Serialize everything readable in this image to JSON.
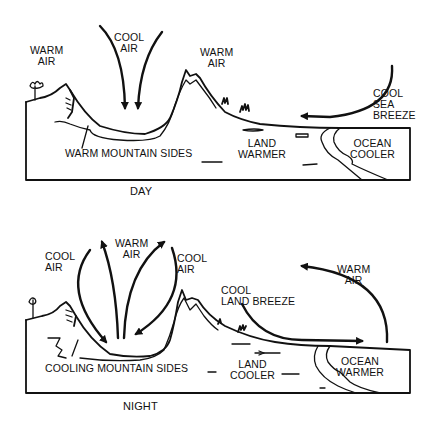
{
  "diagram": {
    "day": {
      "caption": "DAY",
      "labels": {
        "warm_air_left": "WARM\nAIR",
        "cool_air": "COOL\nAIR",
        "warm_air_right": "WARM\nAIR",
        "cool_sea_breeze": "COOL\nSEA\nBREEZE",
        "warm_mountain_sides": "WARM MOUNTAIN SIDES",
        "land_warmer": "LAND\nWARMER",
        "ocean_cooler": "OCEAN\nCOOLER"
      }
    },
    "night": {
      "caption": "NIGHT",
      "labels": {
        "cool_air_left": "COOL\nAIR",
        "warm_air_center": "WARM\nAIR",
        "cool_air_right": "COOL\nAIR",
        "warm_air_right": "WARM\nAIR",
        "cool_land_breeze": "COOL\nLAND BREEZE",
        "cooling_mountain_sides": "COOLING MOUNTAIN SIDES",
        "land_cooler": "LAND\nCOOLER",
        "ocean_warmer": "OCEAN\nWARMER"
      }
    },
    "colors": {
      "ink": "#111111",
      "background": "#ffffff"
    }
  }
}
